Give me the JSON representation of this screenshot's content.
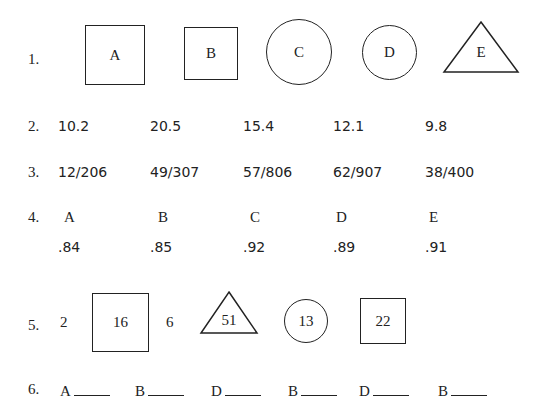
{
  "row1": {
    "label": "1.",
    "shapes": [
      {
        "shape": "square",
        "label": "A"
      },
      {
        "shape": "square",
        "label": "B"
      },
      {
        "shape": "circle",
        "label": "C"
      },
      {
        "shape": "circle",
        "label": "D"
      },
      {
        "shape": "triangle",
        "label": "E"
      }
    ]
  },
  "row2": {
    "label": "2.",
    "values": [
      "10.2",
      "20.5",
      "15.4",
      "12.1",
      "9.8"
    ]
  },
  "row3": {
    "label": "3.",
    "values": [
      "12/206",
      "49/307",
      "57/806",
      "62/907",
      "38/400"
    ]
  },
  "row4": {
    "label": "4.",
    "letters": [
      "A",
      "B",
      "C",
      "D",
      "E"
    ],
    "values": [
      ".84",
      ".85",
      ".92",
      ".89",
      ".91"
    ]
  },
  "row5": {
    "label": "5.",
    "items": [
      {
        "shape": "none",
        "value": "2"
      },
      {
        "shape": "square",
        "value": "16"
      },
      {
        "shape": "none",
        "value": "6"
      },
      {
        "shape": "triangle",
        "value": "51"
      },
      {
        "shape": "circle",
        "value": "13"
      },
      {
        "shape": "square",
        "value": "22"
      }
    ]
  },
  "row6": {
    "label": "6.",
    "letters": [
      "A",
      "B",
      "D",
      "B",
      "D",
      "B"
    ]
  }
}
